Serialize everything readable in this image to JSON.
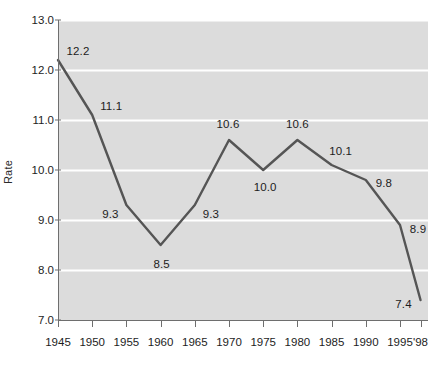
{
  "chart_data": {
    "type": "line",
    "title": "",
    "xlabel": "",
    "ylabel": "Rate",
    "x": [
      1945,
      1950,
      1955,
      1960,
      1965,
      1970,
      1975,
      1980,
      1985,
      1990,
      1995,
      1998
    ],
    "categories": [
      "1945",
      "1950",
      "1955",
      "1960",
      "1965",
      "1970",
      "1975",
      "1980",
      "1985",
      "1990",
      "1995",
      "'98"
    ],
    "values": [
      12.2,
      11.1,
      9.3,
      8.5,
      9.3,
      10.6,
      10.0,
      10.6,
      10.1,
      9.8,
      8.9,
      7.4
    ],
    "point_labels": [
      "12.2",
      "11.1",
      "9.3",
      "8.5",
      "9.3",
      "10.6",
      "10.0",
      "10.6",
      "10.1",
      "9.8",
      "8.9",
      "7.4"
    ],
    "ylim": [
      7.0,
      13.0
    ],
    "yticks": [
      7.0,
      8.0,
      9.0,
      10.0,
      11.0,
      12.0,
      13.0
    ],
    "ytick_labels": [
      "7.0",
      "8.0",
      "9.0",
      "10.0",
      "11.0",
      "12.0",
      "13.0"
    ],
    "grid": true,
    "grid_axis": "y",
    "legend": false,
    "legend_position": "none",
    "series": [
      {
        "name": "Rate",
        "values": [
          12.2,
          11.1,
          9.3,
          8.5,
          9.3,
          10.6,
          10.0,
          10.6,
          10.1,
          9.8,
          8.9,
          7.4
        ]
      }
    ],
    "colors": {
      "line": "#555555",
      "plot_background": "#dcdcdc",
      "gridline": "#ffffff",
      "axis": "#6e6e6e",
      "text": "#1d1d1d",
      "page_background": "#ffffff"
    },
    "label_offsets": [
      {
        "dx": 20,
        "dy": -9
      },
      {
        "dx": 19,
        "dy": -9
      },
      {
        "dx": -16,
        "dy": 9
      },
      {
        "dx": 1,
        "dy": 19
      },
      {
        "dx": 16,
        "dy": 9
      },
      {
        "dx": -1,
        "dy": -16
      },
      {
        "dx": 2,
        "dy": 17
      },
      {
        "dx": 0,
        "dy": -16
      },
      {
        "dx": 9,
        "dy": -14
      },
      {
        "dx": 18,
        "dy": 3
      },
      {
        "dx": 18,
        "dy": 4
      },
      {
        "dx": -17,
        "dy": 4
      }
    ]
  }
}
